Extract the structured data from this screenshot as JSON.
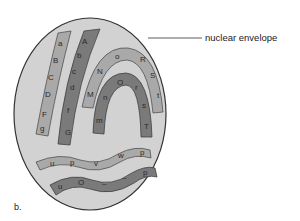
{
  "diagram": {
    "panel_label": "b.",
    "callouts": [
      {
        "text": "nuclear envelope",
        "target": "nucleus-outline"
      }
    ],
    "colors": {
      "nucleoplasm": "#d2d2d2",
      "envelope_stroke": "#333333",
      "chromosome_light": "#a9a9a9",
      "chromosome_dark": "#7a7a7a"
    },
    "chromosomes": [
      {
        "id": "left-light",
        "shade": "light",
        "letters": [
          "a",
          "B",
          "C",
          "D",
          "F",
          "g"
        ]
      },
      {
        "id": "left-dark",
        "shade": "dark",
        "letters": [
          "A",
          "b",
          "c",
          "d",
          "f",
          "G"
        ]
      },
      {
        "id": "arc-light",
        "shade": "light",
        "letters": [
          "M",
          "N",
          "o",
          "R",
          "S",
          "t"
        ]
      },
      {
        "id": "arc-dark",
        "shade": "dark",
        "letters": [
          "m",
          "n",
          "O",
          "r",
          "s",
          "T"
        ]
      },
      {
        "id": "wave-light",
        "shade": "light",
        "letters": [
          "u",
          "p",
          "v",
          "w",
          "p"
        ]
      },
      {
        "id": "wave-dark",
        "shade": "dark",
        "letters": [
          "u",
          "O",
          "–",
          "–",
          "p"
        ]
      }
    ]
  }
}
